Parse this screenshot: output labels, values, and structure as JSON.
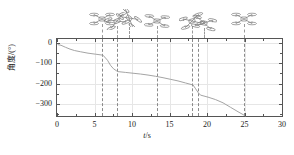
{
  "figure": {
    "background": "#ffffff",
    "frame_color": "#555555",
    "grid_color": "#e6e6e6",
    "curve_color": "#9a9a9a",
    "event_line_color": "#8a8a8a"
  },
  "axes": {
    "x_title": "t/s",
    "x_title_italic": "t",
    "x_title_rest": "/s",
    "y_title": "角度/(°)"
  },
  "chart_data": {
    "type": "line",
    "title": "",
    "subtitle": "",
    "xlabel": "t/s",
    "ylabel": "角度/(°)",
    "xlim": [
      0,
      30
    ],
    "ylim": [
      -360,
      20
    ],
    "grid": true,
    "legend": null,
    "x_ticks": [
      0,
      5,
      10,
      15,
      20,
      25,
      30
    ],
    "x_tick_labels": [
      "0",
      "5",
      "10",
      "15",
      "20",
      "25",
      "30"
    ],
    "x_minor_ticks": [
      2.5,
      7.5,
      12.5,
      17.5,
      22.5,
      27.5
    ],
    "y_ticks": [
      0,
      -100,
      -200,
      -300
    ],
    "y_tick_labels": [
      "0",
      "−100",
      "−200",
      "−300"
    ],
    "y_minor_ticks": [
      -50,
      -150,
      -250,
      -350
    ],
    "series": [
      {
        "name": "yaw angle",
        "color": "#9a9a9a",
        "x": [
          0.0,
          0.4,
          1.0,
          1.6,
          2.2,
          3.0,
          4.0,
          5.0,
          6.0,
          6.6,
          7.0,
          7.4,
          7.8,
          8.0,
          9.0,
          10.0,
          11.0,
          12.0,
          13.0,
          14.0,
          15.0,
          16.0,
          17.0,
          17.6,
          18.0,
          18.3,
          18.7,
          19.0,
          20.0,
          21.0,
          22.0,
          23.0,
          24.0,
          25.0
        ],
        "y": [
          -3,
          -6,
          -16,
          -25,
          -32,
          -38,
          -45,
          -50,
          -55,
          -80,
          -105,
          -122,
          -132,
          -136,
          -140,
          -144,
          -148,
          -153,
          -159,
          -166,
          -174,
          -182,
          -192,
          -198,
          -202,
          -218,
          -240,
          -252,
          -262,
          -274,
          -290,
          -312,
          -334,
          -355
        ]
      }
    ],
    "event_lines": [
      {
        "x": 6.0,
        "label": "event-1"
      },
      {
        "x": 8.0,
        "label": "event-2"
      },
      {
        "x": 13.3,
        "label": "event-3"
      },
      {
        "x": 18.0,
        "label": "event-4"
      },
      {
        "x": 18.8,
        "label": "event-5"
      },
      {
        "x": 24.9,
        "label": "event-6"
      }
    ],
    "annotations": [
      {
        "type": "drone-icon",
        "x": 6.0,
        "name": "drone-icon-1"
      },
      {
        "type": "drone-icon",
        "x": 8.0,
        "name": "drone-icon-2"
      },
      {
        "type": "drone-icon",
        "x": 9.6,
        "name": "drone-icon-3"
      },
      {
        "type": "drone-icon",
        "x": 13.3,
        "name": "drone-icon-4"
      },
      {
        "type": "drone-icon",
        "x": 18.0,
        "name": "drone-icon-5"
      },
      {
        "type": "drone-icon",
        "x": 19.6,
        "name": "drone-icon-6"
      },
      {
        "type": "drone-icon",
        "x": 24.9,
        "name": "drone-icon-7"
      }
    ]
  }
}
